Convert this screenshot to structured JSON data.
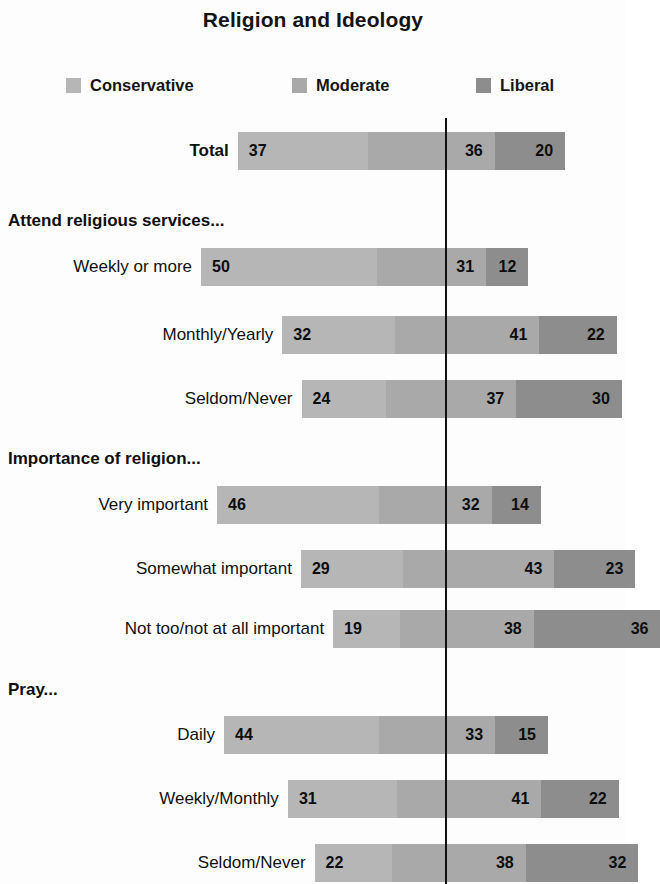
{
  "chart_data": {
    "type": "bar",
    "subtype": "stacked-horizontal-diverging",
    "title": "Religion and Ideology",
    "xlabel": "",
    "ylabel": "",
    "units": "percent",
    "grid": false,
    "legend_position": "top",
    "legend": [
      {
        "name": "Conservative",
        "color": "#b6b6b6"
      },
      {
        "name": "Moderate",
        "color": "#a9a9a9"
      },
      {
        "name": "Liberal",
        "color": "#8d8d8d"
      }
    ],
    "series": [
      {
        "name": "Conservative",
        "values": [
          37,
          50,
          32,
          24,
          46,
          29,
          19,
          44,
          31,
          22
        ]
      },
      {
        "name": "Moderate",
        "values": [
          36,
          31,
          41,
          37,
          32,
          43,
          38,
          33,
          41,
          38
        ]
      },
      {
        "name": "Liberal",
        "values": [
          20,
          12,
          22,
          30,
          14,
          23,
          36,
          15,
          22,
          32
        ]
      }
    ],
    "categories": [
      "Total",
      "Weekly or more",
      "Monthly/Yearly",
      "Seldom/Never",
      "Very important",
      "Somewhat important",
      "Not too/not at all important",
      "Daily",
      "Weekly/Monthly",
      "Seldom/Never"
    ],
    "sections": [
      {
        "heading": "Attend religious services...",
        "categories": [
          "Weekly or more",
          "Monthly/Yearly",
          "Seldom/Never"
        ]
      },
      {
        "heading": "Importance of religion...",
        "categories": [
          "Very important",
          "Somewhat important",
          "Not too/not at all important"
        ]
      },
      {
        "heading": "Pray...",
        "categories": [
          "Daily",
          "Weekly/Monthly",
          "Seldom/Never"
        ]
      }
    ]
  },
  "title": "Religion and Ideology",
  "legend": {
    "items": [
      {
        "label": "Conservative",
        "color": "#b6b6b6"
      },
      {
        "label": "Moderate",
        "color": "#a9a9a9"
      },
      {
        "label": "Liberal",
        "color": "#8d8d8d"
      }
    ]
  },
  "sections": [
    {
      "heading": "Attend religious services..."
    },
    {
      "heading": "Importance of religion..."
    },
    {
      "heading": "Pray..."
    }
  ],
  "rows": [
    {
      "label": "Total",
      "bold": true,
      "conservative": "37",
      "moderate": "36",
      "liberal": "20"
    },
    {
      "label": "Weekly or more",
      "bold": false,
      "conservative": "50",
      "moderate": "31",
      "liberal": "12"
    },
    {
      "label": "Monthly/Yearly",
      "bold": false,
      "conservative": "32",
      "moderate": "41",
      "liberal": "22"
    },
    {
      "label": "Seldom/Never",
      "bold": false,
      "conservative": "24",
      "moderate": "37",
      "liberal": "30"
    },
    {
      "label": "Very important",
      "bold": false,
      "conservative": "46",
      "moderate": "32",
      "liberal": "14"
    },
    {
      "label": "Somewhat important",
      "bold": false,
      "conservative": "29",
      "moderate": "43",
      "liberal": "23"
    },
    {
      "label": "Not too/not at all important",
      "bold": false,
      "conservative": "19",
      "moderate": "38",
      "liberal": "36"
    },
    {
      "label": "Daily",
      "bold": false,
      "conservative": "44",
      "moderate": "33",
      "liberal": "15"
    },
    {
      "label": "Weekly/Monthly",
      "bold": false,
      "conservative": "31",
      "moderate": "41",
      "liberal": "22"
    },
    {
      "label": "Seldom/Never",
      "bold": false,
      "conservative": "22",
      "moderate": "38",
      "liberal": "32"
    }
  ]
}
